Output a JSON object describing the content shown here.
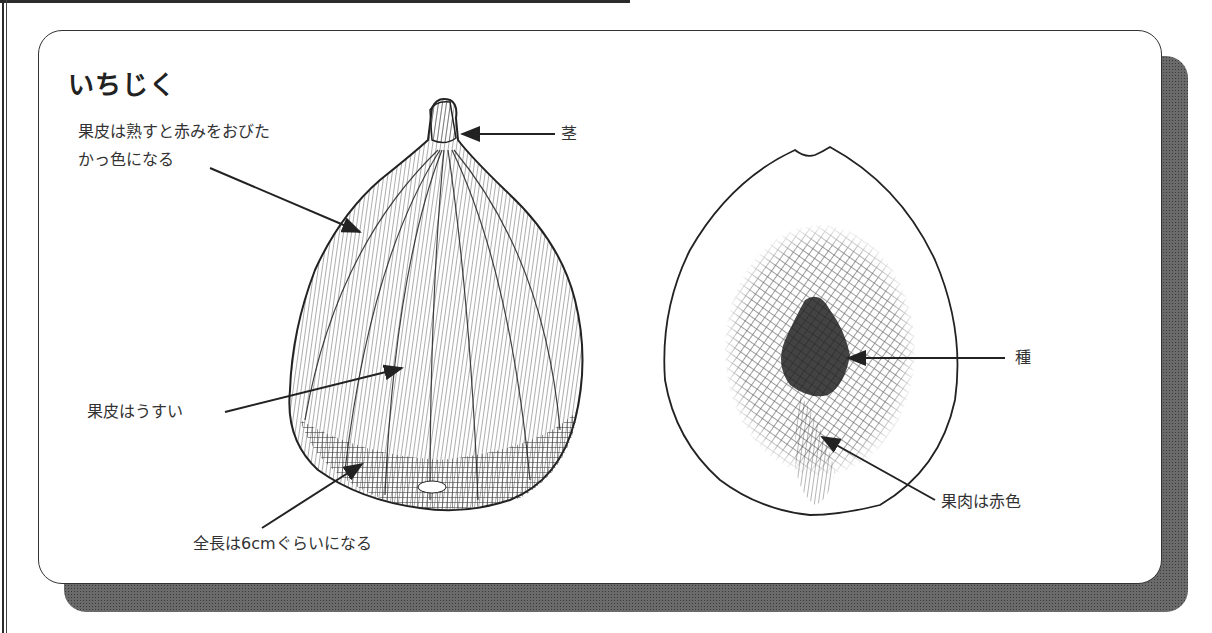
{
  "title": "いちじく",
  "labels": {
    "skin_color_line1": "果皮は熟すと赤みをおびた",
    "skin_color_line2": "かっ色になる",
    "stem": "茎",
    "skin_thin": "果皮はうすい",
    "length": "全長は6cmぐらいになる",
    "seeds": "種",
    "flesh": "果肉は赤色"
  },
  "figures": [
    {
      "name": "whole-fig",
      "description": "exterior view of fig fruit with stem"
    },
    {
      "name": "fig-cross-section",
      "description": "longitudinal cross-section of fig fruit"
    }
  ],
  "colors": {
    "ink": "#2a2a2a",
    "shadow": "#6a6a6a",
    "background": "#ffffff"
  }
}
